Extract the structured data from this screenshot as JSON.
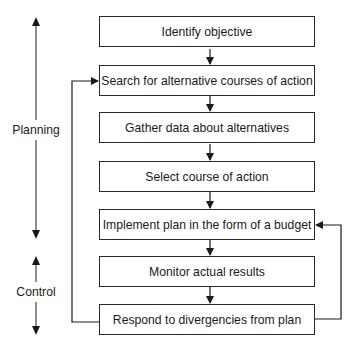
{
  "diagram": {
    "type": "flowchart",
    "steps": [
      {
        "id": "identify",
        "label": "Identify objective"
      },
      {
        "id": "search",
        "label": "Search for alternative courses of action"
      },
      {
        "id": "gather",
        "label": "Gather data about alternatives"
      },
      {
        "id": "select",
        "label": "Select course of action"
      },
      {
        "id": "implement",
        "label": "Implement plan in the form of a budget"
      },
      {
        "id": "monitor",
        "label": "Monitor actual results"
      },
      {
        "id": "respond",
        "label": "Respond to divergencies from plan"
      }
    ],
    "flow": [
      {
        "from": "identify",
        "to": "search"
      },
      {
        "from": "search",
        "to": "gather"
      },
      {
        "from": "gather",
        "to": "select"
      },
      {
        "from": "select",
        "to": "implement"
      },
      {
        "from": "implement",
        "to": "monitor"
      },
      {
        "from": "monitor",
        "to": "respond"
      }
    ],
    "feedback_loops": [
      {
        "from": "respond",
        "to": "search",
        "side": "left"
      },
      {
        "from": "respond",
        "to": "implement",
        "side": "right"
      }
    ],
    "phases": [
      {
        "label": "Planning",
        "spans": [
          "identify",
          "search",
          "gather",
          "select",
          "implement"
        ]
      },
      {
        "label": "Control",
        "spans": [
          "monitor",
          "respond"
        ]
      }
    ],
    "colors": {
      "line": "#2a2a2a",
      "background": "#ffffff",
      "text": "#1a1a1a"
    }
  }
}
